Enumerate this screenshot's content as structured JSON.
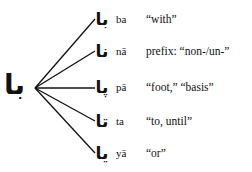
{
  "root": {
    "arabic": "با"
  },
  "branches": [
    {
      "arabic": "با",
      "translit": "ba",
      "gloss": "“with”"
    },
    {
      "arabic": "نا",
      "translit": "nā",
      "gloss": "prefix: “non-/un-”"
    },
    {
      "arabic": "پا",
      "translit": "pā",
      "gloss": "“foot,” “basis”"
    },
    {
      "arabic": "تا",
      "translit": "ta",
      "gloss": "“to, until”"
    },
    {
      "arabic": "یا",
      "translit": "yā",
      "gloss": "“or”"
    }
  ]
}
